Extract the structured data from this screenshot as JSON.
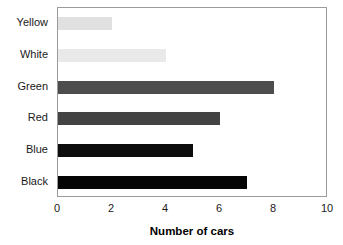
{
  "chart_data": {
    "type": "bar",
    "orientation": "horizontal",
    "title": "",
    "categories": [
      "Yellow",
      "White",
      "Green",
      "Red",
      "Blue",
      "Black"
    ],
    "values": [
      2,
      4,
      8,
      6,
      5,
      7
    ],
    "bar_colors": [
      "#e1e1e1",
      "#e9e9e9",
      "#4d4d4d",
      "#434343",
      "#0d0d0d",
      "#050505"
    ],
    "xlabel": "Number of cars",
    "ylabel": "",
    "xlim": [
      0,
      10
    ],
    "xticks": [
      0,
      2,
      4,
      6,
      8,
      10
    ],
    "xtick_labels": [
      "0",
      "2",
      "4",
      "6",
      "8",
      "10"
    ],
    "grid": false,
    "legend": false,
    "frame_color": "#9a9a9a",
    "background": "#ffffff"
  },
  "title_remnant": "",
  "axis": {
    "x_title": "Number of cars"
  }
}
